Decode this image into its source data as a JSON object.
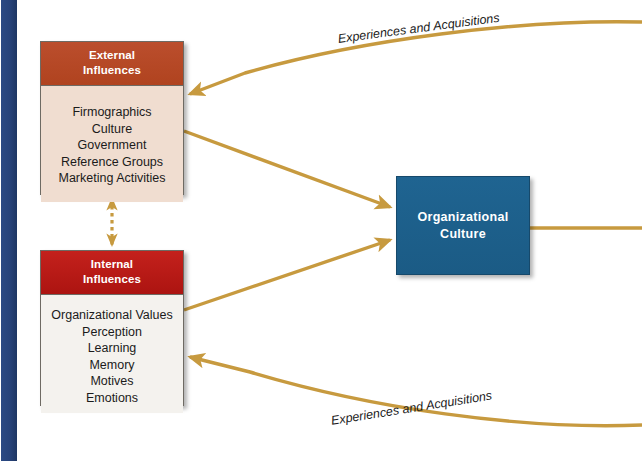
{
  "diagram": {
    "colors": {
      "spine_navy": "#27437a",
      "external_header_red": "#b0431f",
      "external_body": "#f0ddd0",
      "internal_header_red": "#ac1411",
      "internal_body": "#f4f2ee",
      "culture_blue": "#1b5b85",
      "connector_gold": "#c79a3f"
    },
    "boxes": {
      "external": {
        "header_line1": "External",
        "header_line2": "Influences",
        "items": [
          "Firmographics",
          "Culture",
          "Government",
          "Reference Groups",
          "Marketing Activities"
        ]
      },
      "internal": {
        "header_line1": "Internal",
        "header_line2": "Influences",
        "items": [
          "Organizational Values",
          "Perception",
          "Learning",
          "Memory",
          "Motives",
          "Emotions"
        ]
      },
      "culture": {
        "line1": "Organizational",
        "line2": "Culture"
      }
    },
    "connector_labels": {
      "top": "Experiences and Acquisitions",
      "bottom": "Experiences and Acquisitions"
    }
  }
}
